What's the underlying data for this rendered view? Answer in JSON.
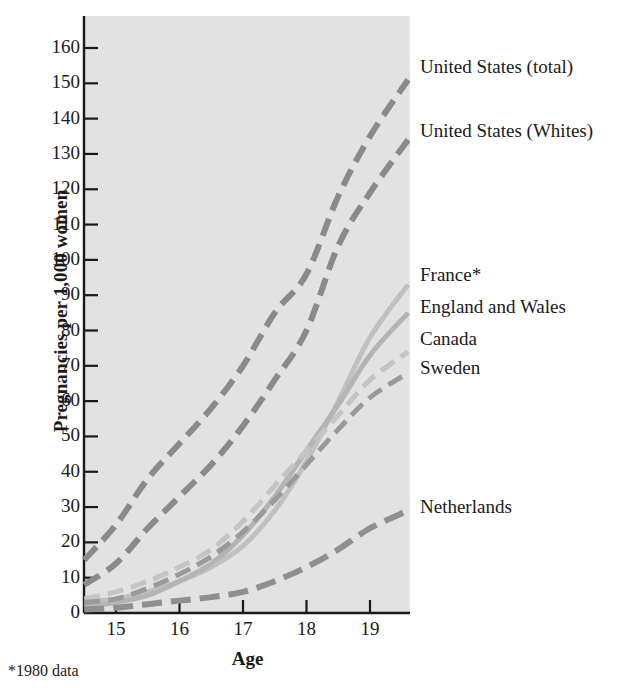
{
  "chart_data": {
    "type": "line",
    "title": "",
    "xlabel": "Age",
    "ylabel": "Pregnancies per 1,000 women",
    "footnote": "*1980 data",
    "xlim": [
      14.5,
      19.6
    ],
    "ylim": [
      0,
      167
    ],
    "xticks": [
      15,
      16,
      17,
      18,
      19
    ],
    "yticks": [
      0,
      10,
      20,
      30,
      40,
      50,
      60,
      70,
      80,
      90,
      100,
      110,
      120,
      130,
      140,
      150,
      160
    ],
    "grid": false,
    "legend_position": "right-inline",
    "x": [
      14.5,
      15,
      15.5,
      16,
      16.5,
      17,
      17.5,
      18,
      18.5,
      19,
      19.6
    ],
    "series": [
      {
        "name": "United States (total)",
        "color": "#8a8a8a",
        "dash": "18 9",
        "width": 6,
        "values": [
          15,
          25,
          38,
          48,
          58,
          70,
          85,
          96,
          118,
          135,
          151
        ]
      },
      {
        "name": "United States (Whites)",
        "color": "#8a8a8a",
        "dash": "18 9",
        "width": 6,
        "values": [
          8,
          14,
          24,
          33,
          42,
          53,
          66,
          80,
          104,
          119,
          134
        ]
      },
      {
        "name": "France*",
        "color": "#c0c0c0",
        "dash": "0",
        "width": 5,
        "values": [
          3,
          4,
          6,
          9,
          13,
          19,
          29,
          43,
          60,
          78,
          93
        ]
      },
      {
        "name": "England and Wales",
        "color": "#b4b4b4",
        "dash": "0",
        "width": 5,
        "values": [
          2,
          3,
          5,
          9,
          14,
          22,
          33,
          46,
          59,
          73,
          85
        ]
      },
      {
        "name": "Canada",
        "color": "#c4c4c4",
        "dash": "16 8",
        "width": 5,
        "values": [
          4,
          6,
          9,
          13,
          18,
          26,
          36,
          46,
          56,
          66,
          74
        ]
      },
      {
        "name": "Sweden",
        "color": "#9a9a9a",
        "dash": "16 8",
        "width": 5,
        "values": [
          3,
          4,
          7,
          11,
          16,
          23,
          32,
          42,
          52,
          61,
          68
        ]
      },
      {
        "name": "Netherlands",
        "color": "#8f8f8f",
        "dash": "20 9",
        "width": 6,
        "values": [
          1,
          1.5,
          2.5,
          3.5,
          4.5,
          6,
          9,
          13,
          18,
          24,
          29
        ]
      }
    ]
  },
  "axis": {
    "y_title": "Pregnancies per 1,000 women",
    "x_title": "Age",
    "y_labels": [
      "160",
      "150",
      "140",
      "130",
      "120",
      "110",
      "100",
      "90",
      "80",
      "70",
      "60",
      "50",
      "40",
      "30",
      "20",
      "10",
      "0"
    ],
    "x_labels": [
      "15",
      "16",
      "17",
      "18",
      "19"
    ]
  },
  "legend": {
    "items": [
      {
        "label": "United States (total)",
        "top": 56
      },
      {
        "label": "United States (Whites)",
        "top": 120
      },
      {
        "label": "France*",
        "top": 264
      },
      {
        "label": "England and Wales",
        "top": 296
      },
      {
        "label": "Canada",
        "top": 328
      },
      {
        "label": "Sweden",
        "top": 357
      },
      {
        "label": "Netherlands",
        "top": 496
      }
    ]
  },
  "footnote": "*1980 data",
  "colors": {
    "plot_background": "#e2e2e2",
    "axis": "#1a1a1a",
    "text": "#1a1a1a"
  }
}
